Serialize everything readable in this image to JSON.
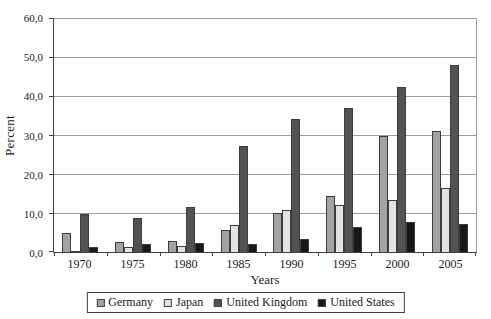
{
  "colors": {
    "background": "#ffffff",
    "axis": "#404040",
    "gridline": "#9c9c9c",
    "bar_border": "#3d3d3d",
    "germany": "#a3a3a3",
    "japan": "#e3e3e3",
    "united_kingdom": "#525252",
    "united_states": "#171717"
  },
  "chart_data": {
    "type": "bar",
    "title": "",
    "xlabel": "Years",
    "ylabel": "Percent",
    "ylim": [
      0,
      60
    ],
    "ytick_step": 10,
    "ytick_labels": [
      "0,0",
      "10,0",
      "20,0",
      "30,0",
      "40,0",
      "50,0",
      "60,0"
    ],
    "grid": true,
    "legend_position": "bottom",
    "categories": [
      "1970",
      "1975",
      "1980",
      "1985",
      "1990",
      "1995",
      "2000",
      "2005"
    ],
    "series": [
      {
        "name": "Germany",
        "color": "#a3a3a3",
        "values": [
          5.0,
          2.6,
          2.9,
          5.6,
          10.0,
          14.3,
          29.7,
          31.0
        ]
      },
      {
        "name": "Japan",
        "color": "#e3e3e3",
        "values": [
          0.2,
          1.3,
          1.6,
          6.8,
          10.7,
          12.0,
          13.3,
          16.3
        ]
      },
      {
        "name": "United Kingdom",
        "color": "#525252",
        "values": [
          9.7,
          8.7,
          11.5,
          27.3,
          34.0,
          36.9,
          42.4,
          48.0
        ]
      },
      {
        "name": "United States",
        "color": "#171717",
        "values": [
          1.4,
          2.0,
          2.3,
          2.0,
          3.3,
          6.3,
          7.7,
          7.3
        ]
      }
    ]
  }
}
